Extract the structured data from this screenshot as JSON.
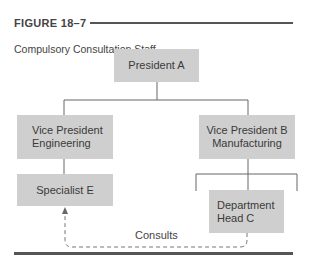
{
  "figure": {
    "label": "FIGURE 18–7",
    "title": "Compulsory Consultation Staff"
  },
  "nodes": {
    "president": {
      "label": "President A"
    },
    "vp_engineering": {
      "line1": "Vice President",
      "line2": "Engineering"
    },
    "vp_manufacturing": {
      "line1": "Vice President B",
      "line2": "Manufacturing"
    },
    "specialist": {
      "label": "Specialist E"
    },
    "department_head": {
      "line1": "Department",
      "line2": "Head C"
    }
  },
  "edges": {
    "consults_label": "Consults"
  },
  "colors": {
    "box_fill": "#cfcfcf",
    "line": "#666666",
    "rule": "#555555"
  }
}
